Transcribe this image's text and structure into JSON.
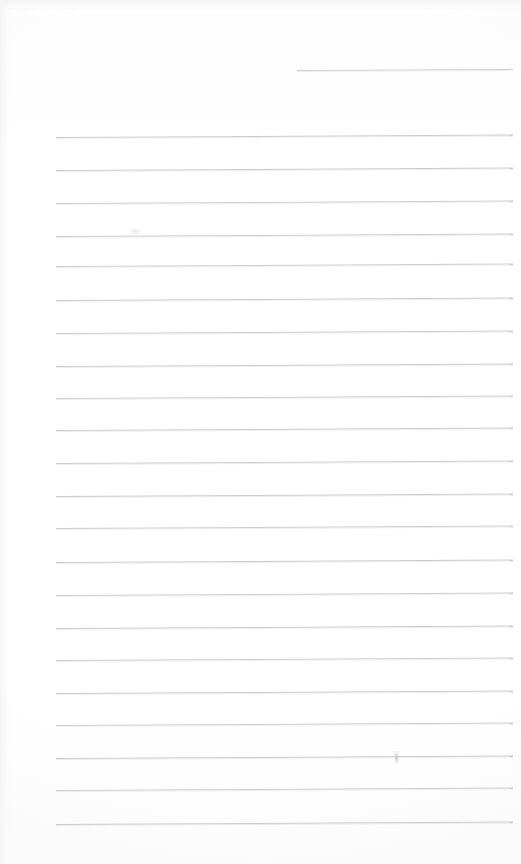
{
  "document": {
    "kind": "scanned-blank-lined-paper",
    "page_width": 521,
    "page_height": 864,
    "paper_color": "#ffffff",
    "rule_color": "#c9c7c6",
    "rule_count": 23,
    "text_content": "",
    "visible_text": []
  },
  "rules": [
    {
      "id": "rule-1",
      "y": 70,
      "x_start": 297,
      "x_end": 513,
      "tilt_deg": -0.3,
      "opacity": 0.85,
      "partial": true
    },
    {
      "id": "rule-2",
      "y": 137,
      "x_start": 56,
      "x_end": 513,
      "tilt_deg": -0.32,
      "opacity": 0.9,
      "partial": false
    },
    {
      "id": "rule-3",
      "y": 170,
      "x_start": 56,
      "x_end": 513,
      "tilt_deg": -0.32,
      "opacity": 0.92,
      "partial": false
    },
    {
      "id": "rule-4",
      "y": 203,
      "x_start": 56,
      "x_end": 513,
      "tilt_deg": -0.32,
      "opacity": 0.88,
      "partial": false
    },
    {
      "id": "rule-5",
      "y": 236,
      "x_start": 56,
      "x_end": 513,
      "tilt_deg": -0.32,
      "opacity": 0.9,
      "partial": false
    },
    {
      "id": "rule-6",
      "y": 266,
      "x_start": 56,
      "x_end": 513,
      "tilt_deg": -0.32,
      "opacity": 0.88,
      "partial": false
    },
    {
      "id": "rule-7",
      "y": 300,
      "x_start": 56,
      "x_end": 513,
      "tilt_deg": -0.32,
      "opacity": 0.92,
      "partial": false
    },
    {
      "id": "rule-8",
      "y": 333,
      "x_start": 56,
      "x_end": 513,
      "tilt_deg": -0.32,
      "opacity": 0.88,
      "partial": false
    },
    {
      "id": "rule-9",
      "y": 366,
      "x_start": 56,
      "x_end": 513,
      "tilt_deg": -0.32,
      "opacity": 0.92,
      "partial": false
    },
    {
      "id": "rule-10",
      "y": 398,
      "x_start": 56,
      "x_end": 513,
      "tilt_deg": -0.32,
      "opacity": 0.88,
      "partial": false
    },
    {
      "id": "rule-11",
      "y": 430,
      "x_start": 56,
      "x_end": 513,
      "tilt_deg": -0.32,
      "opacity": 0.92,
      "partial": false
    },
    {
      "id": "rule-12",
      "y": 463,
      "x_start": 56,
      "x_end": 513,
      "tilt_deg": -0.32,
      "opacity": 0.9,
      "partial": false
    },
    {
      "id": "rule-13",
      "y": 496,
      "x_start": 56,
      "x_end": 513,
      "tilt_deg": -0.32,
      "opacity": 0.92,
      "partial": false
    },
    {
      "id": "rule-14",
      "y": 528,
      "x_start": 56,
      "x_end": 513,
      "tilt_deg": -0.32,
      "opacity": 0.88,
      "partial": false
    },
    {
      "id": "rule-15",
      "y": 562,
      "x_start": 56,
      "x_end": 513,
      "tilt_deg": -0.32,
      "opacity": 0.92,
      "partial": false
    },
    {
      "id": "rule-16",
      "y": 595,
      "x_start": 56,
      "x_end": 513,
      "tilt_deg": -0.32,
      "opacity": 0.88,
      "partial": false
    },
    {
      "id": "rule-17",
      "y": 628,
      "x_start": 56,
      "x_end": 513,
      "tilt_deg": -0.32,
      "opacity": 0.92,
      "partial": false
    },
    {
      "id": "rule-18",
      "y": 660,
      "x_start": 56,
      "x_end": 513,
      "tilt_deg": -0.32,
      "opacity": 0.88,
      "partial": false
    },
    {
      "id": "rule-19",
      "y": 693,
      "x_start": 56,
      "x_end": 513,
      "tilt_deg": -0.32,
      "opacity": 0.92,
      "partial": false
    },
    {
      "id": "rule-20",
      "y": 725,
      "x_start": 56,
      "x_end": 513,
      "tilt_deg": -0.32,
      "opacity": 0.88,
      "partial": false
    },
    {
      "id": "rule-21",
      "y": 758,
      "x_start": 56,
      "x_end": 513,
      "tilt_deg": -0.32,
      "opacity": 0.92,
      "partial": false
    },
    {
      "id": "rule-22",
      "y": 790,
      "x_start": 56,
      "x_end": 513,
      "tilt_deg": -0.32,
      "opacity": 0.88,
      "partial": false
    },
    {
      "id": "rule-23",
      "y": 824,
      "x_start": 56,
      "x_end": 513,
      "tilt_deg": -0.32,
      "opacity": 0.92,
      "partial": false
    }
  ],
  "marks": [
    {
      "id": "smudge-1",
      "x": 394,
      "y": 751,
      "w": 5,
      "h": 13
    },
    {
      "id": "smudge-2",
      "x": 128,
      "y": 227,
      "w": 14,
      "h": 9
    }
  ]
}
